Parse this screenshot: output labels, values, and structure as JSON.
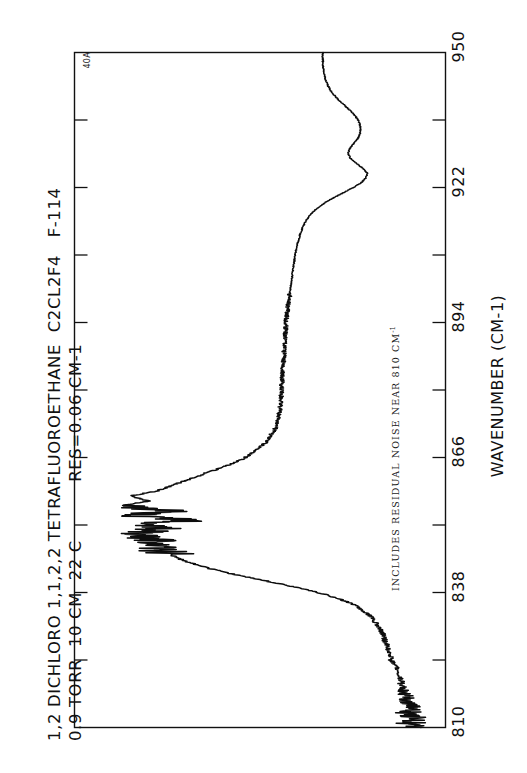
{
  "document": {
    "kind": "infrared-absorption-spectrum",
    "orientation": "rotated-90-ccw"
  },
  "header": {
    "line1": "1,2 DICHLORO 1,1,2,2 TETRAFLUOROETHANE  C2CL2F4   F-114",
    "line2": "0.9 TORR  10 CM  22 C          RES=0.06 CM-1"
  },
  "ordinate": {
    "annotation": "40A"
  },
  "annotations": {
    "note_text": "INCLUDES RESIDUAL NOISE NEAR 810 CM",
    "note_superscript": "-1"
  },
  "axis": {
    "title": "WAVENUMBER (CM-1)",
    "tick_labels": [
      "810",
      "838",
      "866",
      "894",
      "922",
      "950"
    ]
  },
  "chart_data": {
    "type": "line",
    "title": "1,2 DICHLORO 1,1,2,2 TETRAFLUOROETHANE  C2CL2F4   F-114",
    "subtitle": "0.9 TORR  10 CM  22 C          RES=0.06 CM-1",
    "xlabel": "WAVENUMBER (CM-1)",
    "ylabel": "ABSORBANCE",
    "xlim": [
      810,
      950
    ],
    "ylim": [
      0,
      1
    ],
    "xticks_major": [
      810,
      838,
      866,
      894,
      922,
      950
    ],
    "xticks_minor": [
      824,
      852,
      880,
      908,
      936
    ],
    "grid": false,
    "legend": null,
    "annotation": "INCLUDES RESIDUAL NOISE NEAR 810 CM-1",
    "ordinate_scale": "40A",
    "series": [
      {
        "name": "transmission-trace",
        "x": [
          810,
          811,
          812,
          813,
          814,
          815,
          816,
          817,
          818,
          819,
          820,
          821,
          822,
          823,
          824,
          825,
          826,
          827,
          828,
          829,
          830,
          831,
          832,
          833,
          834,
          835,
          836,
          837,
          838,
          839,
          840,
          841,
          842,
          843,
          844,
          845,
          846,
          847,
          848,
          849,
          850,
          851,
          852,
          853,
          854,
          855,
          856,
          857,
          858,
          859,
          860,
          861,
          862,
          863,
          864,
          865,
          866,
          867,
          868,
          869,
          870,
          871,
          872,
          873,
          874,
          875,
          876,
          877,
          878,
          879,
          880,
          881,
          882,
          883,
          884,
          885,
          886,
          887,
          888,
          889,
          890,
          891,
          892,
          893,
          894,
          895,
          896,
          897,
          898,
          899,
          900,
          901,
          902,
          903,
          904,
          905,
          906,
          907,
          908,
          909,
          910,
          911,
          912,
          913,
          914,
          915,
          916,
          917,
          918,
          919,
          920,
          921,
          922,
          923,
          924,
          925,
          926,
          927,
          928,
          929,
          930,
          931,
          932,
          933,
          934,
          935,
          936,
          937,
          938,
          939,
          940,
          941,
          942,
          943,
          944,
          945,
          946,
          947,
          948,
          949,
          950
        ],
        "y": [
          0.04,
          0.05,
          0.04,
          0.06,
          0.05,
          0.06,
          0.06,
          0.07,
          0.07,
          0.08,
          0.08,
          0.09,
          0.09,
          0.1,
          0.11,
          0.11,
          0.12,
          0.12,
          0.13,
          0.13,
          0.14,
          0.15,
          0.16,
          0.17,
          0.19,
          0.21,
          0.24,
          0.28,
          0.33,
          0.39,
          0.46,
          0.53,
          0.6,
          0.66,
          0.71,
          0.75,
          0.78,
          0.8,
          0.82,
          0.84,
          0.86,
          0.8,
          0.88,
          0.72,
          0.9,
          0.78,
          0.92,
          0.84,
          0.9,
          0.82,
          0.78,
          0.74,
          0.7,
          0.66,
          0.62,
          0.58,
          0.55,
          0.53,
          0.51,
          0.49,
          0.48,
          0.47,
          0.46,
          0.455,
          0.45,
          0.448,
          0.446,
          0.444,
          0.443,
          0.442,
          0.441,
          0.44,
          0.439,
          0.438,
          0.437,
          0.436,
          0.435,
          0.434,
          0.433,
          0.432,
          0.431,
          0.43,
          0.429,
          0.428,
          0.427,
          0.426,
          0.424,
          0.422,
          0.42,
          0.418,
          0.416,
          0.414,
          0.412,
          0.41,
          0.408,
          0.406,
          0.404,
          0.402,
          0.4,
          0.397,
          0.394,
          0.39,
          0.386,
          0.381,
          0.375,
          0.368,
          0.358,
          0.345,
          0.328,
          0.306,
          0.28,
          0.252,
          0.224,
          0.2,
          0.186,
          0.182,
          0.195,
          0.215,
          0.232,
          0.24,
          0.236,
          0.224,
          0.212,
          0.205,
          0.202,
          0.204,
          0.21,
          0.22,
          0.234,
          0.25,
          0.266,
          0.28,
          0.292,
          0.3,
          0.306,
          0.31,
          0.313,
          0.315,
          0.316,
          0.317,
          0.317
        ],
        "description": "Strong absorption band near 848-852 cm-1 with sharp Q-branch structure; broad band near 918-928 cm-1; heavy residual noise near 810 cm-1"
      }
    ]
  }
}
